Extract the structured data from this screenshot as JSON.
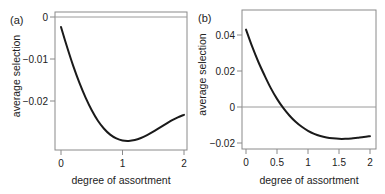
{
  "chart_data": [
    {
      "type": "line",
      "panel_label": "(a)",
      "xlabel": "degree of assortment",
      "ylabel": "average selection",
      "xlim": [
        0,
        2
      ],
      "ylim": [
        -0.03,
        0.0008
      ],
      "xticks": [
        0,
        1,
        2
      ],
      "xtick_labels": [
        "0",
        "1",
        "2"
      ],
      "yticks": [
        0,
        -0.01,
        -0.02
      ],
      "ytick_labels": [
        "0",
        "−0.01",
        "−0.02"
      ],
      "reference_line_y": 0,
      "grid": false,
      "series": [
        {
          "name": "average selection",
          "x": [
            0,
            0.1,
            0.2,
            0.3,
            0.4,
            0.5,
            0.6,
            0.7,
            0.8,
            0.9,
            1.0,
            1.1,
            1.2,
            1.3,
            1.4,
            1.5,
            1.6,
            1.7,
            1.8,
            1.9,
            2.0
          ],
          "y": [
            -0.0024,
            -0.0072,
            -0.0117,
            -0.0157,
            -0.0192,
            -0.0222,
            -0.0247,
            -0.0266,
            -0.028,
            -0.0289,
            -0.0294,
            -0.0295,
            -0.0293,
            -0.0288,
            -0.0281,
            -0.0273,
            -0.0264,
            -0.0255,
            -0.0246,
            -0.0239,
            -0.0233
          ]
        }
      ]
    },
    {
      "type": "line",
      "panel_label": "(b)",
      "xlabel": "degree of assortment",
      "ylabel": "average selection",
      "xlim": [
        0,
        2
      ],
      "ylim": [
        -0.0205,
        0.052
      ],
      "xticks": [
        0,
        0.5,
        1,
        1.5,
        2
      ],
      "xtick_labels": [
        "0",
        "0.5",
        "1",
        "1.5",
        "2"
      ],
      "yticks": [
        0.04,
        0.02,
        0,
        -0.02
      ],
      "ytick_labels": [
        "0.04",
        "0.02",
        "0",
        "−0.02"
      ],
      "reference_line_y": 0,
      "grid": false,
      "series": [
        {
          "name": "average selection",
          "x": [
            0,
            0.1,
            0.2,
            0.3,
            0.4,
            0.5,
            0.6,
            0.7,
            0.8,
            0.9,
            1.0,
            1.1,
            1.2,
            1.3,
            1.4,
            1.5,
            1.6,
            1.7,
            1.8,
            1.9,
            2.0
          ],
          "y": [
            0.043,
            0.0335,
            0.025,
            0.0175,
            0.0105,
            0.0045,
            -0.0005,
            -0.0047,
            -0.0082,
            -0.011,
            -0.0132,
            -0.0149,
            -0.0161,
            -0.0169,
            -0.0174,
            -0.0177,
            -0.0177,
            -0.0175,
            -0.0171,
            -0.0167,
            -0.0162
          ]
        }
      ]
    }
  ],
  "panels": [
    {
      "label": "(a)",
      "xlabel": "degree of assortment",
      "ylabel": "average selection"
    },
    {
      "label": "(b)",
      "xlabel": "degree of assortment",
      "ylabel": "average selection"
    }
  ],
  "colors": {
    "curve": "#1a1a1a",
    "frame": "#8a8a8a",
    "zero_line": "#9a9a9a",
    "text": "#222222"
  }
}
